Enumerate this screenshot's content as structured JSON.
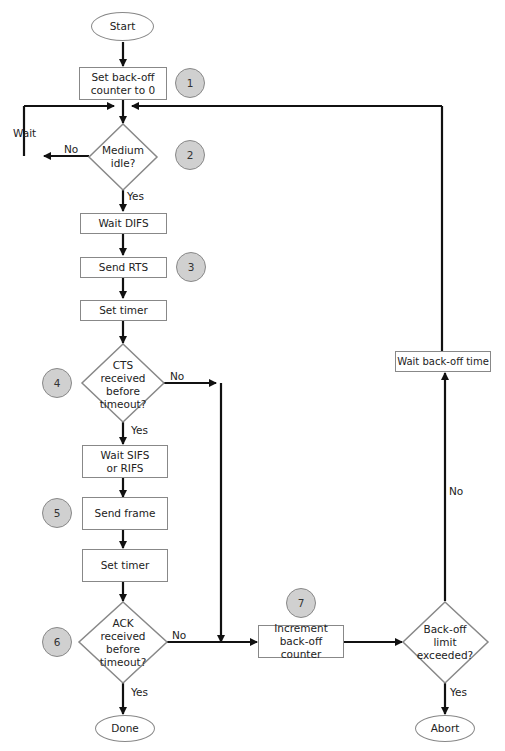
{
  "diagram": {
    "nodes": {
      "start": "Start",
      "set_counter": "Set back-off counter to 0",
      "medium_idle": "Medium idle?",
      "wait_difs": "Wait DIFS",
      "send_rts": "Send RTS",
      "set_timer_1": "Set timer",
      "cts_received": "CTS received before timeout?",
      "wait_sifs": "Wait SIFS or RIFS",
      "send_frame": "Send frame",
      "set_timer_2": "Set timer",
      "ack_received": "ACK received before timeout?",
      "done": "Done",
      "increment_counter": "Increment back-off counter",
      "backoff_limit": "Back-off limit exceeded?",
      "abort": "Abort",
      "wait_backoff": "Wait back-off time"
    },
    "badges": [
      "1",
      "2",
      "3",
      "4",
      "5",
      "6",
      "7"
    ],
    "edge_labels": {
      "wait": "Wait",
      "no_medium": "No",
      "yes_medium": "Yes",
      "no_cts": "No",
      "yes_cts": "Yes",
      "no_ack": "No",
      "yes_ack": "Yes",
      "no_limit": "No",
      "yes_limit": "Yes"
    }
  }
}
